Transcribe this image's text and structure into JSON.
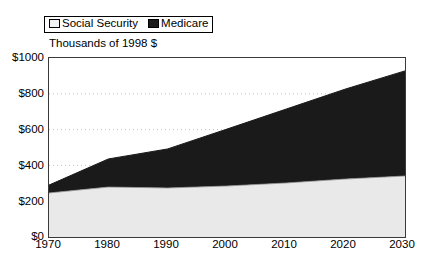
{
  "legend": {
    "position": "top-left",
    "entries": [
      {
        "label": "Social Security",
        "swatch": "light-gray-square",
        "color": "#f2f2f2"
      },
      {
        "label": "Medicare",
        "swatch": "black-square",
        "color": "#1a1a1a"
      }
    ]
  },
  "axis_title": "Thousands of 1998 $",
  "y_axis": {
    "ticks": [
      "$1000",
      "$800",
      "$600",
      "$400",
      "$200",
      "$0"
    ]
  },
  "x_axis": {
    "ticks": [
      "1970",
      "1980",
      "1990",
      "2000",
      "2010",
      "2020",
      "2030"
    ]
  },
  "chart_data": {
    "type": "area",
    "stacked": true,
    "title": "",
    "subtitle": "",
    "xlabel": "",
    "ylabel": "Thousands of 1998 $",
    "x": [
      1970,
      1980,
      1990,
      2000,
      2010,
      2020,
      2030
    ],
    "xlim": [
      1970,
      2030
    ],
    "ylim": [
      0,
      1000
    ],
    "ytick_values": [
      0,
      200,
      400,
      600,
      800,
      1000
    ],
    "ytick_labels": [
      "$0",
      "$200",
      "$400",
      "$600",
      "$800",
      "$1000"
    ],
    "xtick_values": [
      1970,
      1980,
      1990,
      2000,
      2010,
      2020,
      2030
    ],
    "xtick_labels": [
      "1970",
      "1980",
      "1990",
      "2000",
      "2010",
      "2020",
      "2030"
    ],
    "grid": "horizontal-dotted",
    "legend_position": "above-plot-left",
    "series": [
      {
        "name": "Social Security",
        "color": "#e9e9e9",
        "values": [
          246,
          279,
          274,
          285,
          302,
          324,
          341
        ]
      },
      {
        "name": "Medicare",
        "color": "#1a1a1a",
        "values": [
          44,
          157,
          218,
          318,
          413,
          503,
          587
        ]
      }
    ],
    "cumulative_totals": [
      290,
      436,
      492,
      603,
      715,
      827,
      928
    ],
    "annotations": []
  }
}
